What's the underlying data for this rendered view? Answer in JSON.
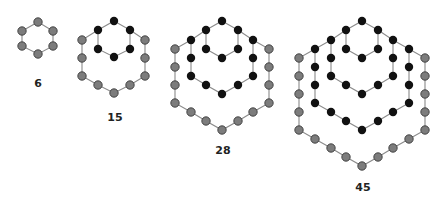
{
  "colors": {
    "background": "#ffffff",
    "new_dot": "#7c7c7c",
    "new_dot_stroke": "#3a3a3a",
    "old_dot": "#111111",
    "line": "#8a8a8a",
    "label": "#222222"
  },
  "figures": [
    {
      "label": "6",
      "label_pos": [
        38,
        87
      ],
      "rings": [
        {
          "type": "new",
          "points": [
            [
              38,
              22
            ],
            [
              53,
              31
            ],
            [
              53,
              46
            ],
            [
              38,
              54
            ],
            [
              22,
              46
            ],
            [
              22,
              31
            ]
          ]
        }
      ]
    },
    {
      "label": "15",
      "label_pos": [
        115,
        121
      ],
      "rings": [
        {
          "type": "old",
          "points": [
            [
              114,
              21
            ],
            [
              130,
              30
            ],
            [
              130,
              49
            ],
            [
              114,
              57
            ],
            [
              98,
              49
            ],
            [
              98,
              30
            ]
          ]
        },
        {
          "type": "new",
          "points": [
            [
              98,
              30
            ],
            [
              82,
              40
            ],
            [
              82,
              58
            ],
            [
              82,
              76
            ],
            [
              98,
              85
            ],
            [
              114,
              93
            ],
            [
              130,
              85
            ],
            [
              145,
              76
            ],
            [
              145,
              58
            ],
            [
              145,
              40
            ],
            [
              130,
              30
            ]
          ],
          "dots_from": 1,
          "dots_to": 9
        }
      ]
    },
    {
      "label": "28",
      "label_pos": [
        223,
        154
      ],
      "rings": [
        {
          "type": "old",
          "points": [
            [
              222,
              21
            ],
            [
              238,
              30
            ],
            [
              238,
              49
            ],
            [
              222,
              58
            ],
            [
              206,
              49
            ],
            [
              206,
              30
            ]
          ]
        },
        {
          "type": "old",
          "points": [
            [
              206,
              30
            ],
            [
              191,
              40
            ],
            [
              191,
              58
            ],
            [
              191,
              76
            ],
            [
              206,
              85
            ],
            [
              222,
              94
            ],
            [
              238,
              85
            ],
            [
              253,
              76
            ],
            [
              253,
              58
            ],
            [
              253,
              40
            ],
            [
              238,
              30
            ]
          ],
          "dots_from": 1,
          "dots_to": 9
        },
        {
          "type": "new",
          "points": [
            [
              191,
              40
            ],
            [
              175,
              49
            ],
            [
              175,
              67
            ],
            [
              175,
              85
            ],
            [
              175,
              103
            ],
            [
              191,
              112
            ],
            [
              206,
              121
            ],
            [
              222,
              130
            ],
            [
              238,
              121
            ],
            [
              253,
              112
            ],
            [
              269,
              103
            ],
            [
              269,
              85
            ],
            [
              269,
              67
            ],
            [
              269,
              49
            ],
            [
              253,
              40
            ]
          ],
          "dots_from": 1,
          "dots_to": 13
        }
      ]
    },
    {
      "label": "45",
      "label_pos": [
        363,
        191
      ],
      "rings": [
        {
          "type": "old",
          "points": [
            [
              362,
              21
            ],
            [
              378,
              30
            ],
            [
              378,
              49
            ],
            [
              362,
              58
            ],
            [
              346,
              49
            ],
            [
              346,
              30
            ]
          ]
        },
        {
          "type": "old",
          "points": [
            [
              346,
              30
            ],
            [
              331,
              40
            ],
            [
              331,
              58
            ],
            [
              331,
              76
            ],
            [
              346,
              85
            ],
            [
              362,
              94
            ],
            [
              378,
              85
            ],
            [
              393,
              76
            ],
            [
              393,
              58
            ],
            [
              393,
              40
            ],
            [
              378,
              30
            ]
          ],
          "dots_from": 1,
          "dots_to": 9
        },
        {
          "type": "old",
          "points": [
            [
              331,
              40
            ],
            [
              315,
              49
            ],
            [
              315,
              67
            ],
            [
              315,
              85
            ],
            [
              315,
              103
            ],
            [
              331,
              112
            ],
            [
              346,
              121
            ],
            [
              362,
              130
            ],
            [
              378,
              121
            ],
            [
              393,
              112
            ],
            [
              409,
              103
            ],
            [
              409,
              85
            ],
            [
              409,
              67
            ],
            [
              409,
              49
            ],
            [
              393,
              40
            ]
          ],
          "dots_from": 1,
          "dots_to": 13
        },
        {
          "type": "new",
          "points": [
            [
              315,
              49
            ],
            [
              299,
              58
            ],
            [
              299,
              76
            ],
            [
              299,
              94
            ],
            [
              299,
              112
            ],
            [
              299,
              130
            ],
            [
              315,
              139
            ],
            [
              331,
              148
            ],
            [
              346,
              157
            ],
            [
              362,
              166
            ],
            [
              378,
              157
            ],
            [
              393,
              148
            ],
            [
              409,
              139
            ],
            [
              425,
              130
            ],
            [
              425,
              112
            ],
            [
              425,
              94
            ],
            [
              425,
              76
            ],
            [
              425,
              58
            ],
            [
              409,
              49
            ]
          ],
          "dots_from": 1,
          "dots_to": 17
        }
      ]
    }
  ]
}
